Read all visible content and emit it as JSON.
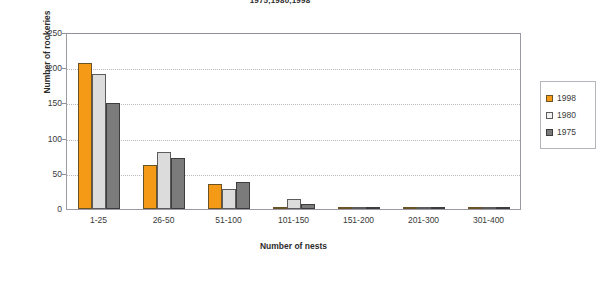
{
  "chart_data": {
    "type": "bar",
    "title": "1975,1980,1998",
    "xlabel": "Number of nests",
    "ylabel": "Number of rookeries",
    "categories": [
      "1-25",
      "26-50",
      "51-100",
      "101-150",
      "151-200",
      "201-300",
      "301-400"
    ],
    "series": [
      {
        "name": "1998",
        "color": "#f49a16",
        "values": [
          208,
          63,
          35,
          3,
          2,
          1,
          0
        ]
      },
      {
        "name": "1980",
        "color": "#dcdcdc",
        "values": [
          192,
          81,
          28,
          14,
          3,
          0,
          0
        ]
      },
      {
        "name": "1975",
        "color": "#7b7b7b",
        "values": [
          150,
          72,
          38,
          7,
          2,
          0,
          0
        ]
      }
    ],
    "ylim": [
      0,
      250
    ],
    "yticks": [
      0,
      50,
      100,
      150,
      200,
      250
    ],
    "ytick_labels": [
      "0",
      "50",
      "100",
      "150",
      "200",
      "250"
    ],
    "grid": "horizontal-dotted",
    "legend_position": "right",
    "legend_entries": [
      "1998",
      "1980",
      "1975"
    ]
  }
}
